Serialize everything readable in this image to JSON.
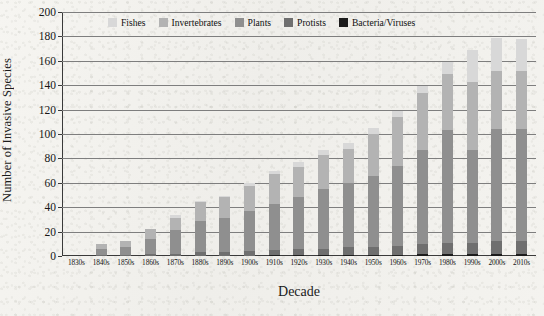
{
  "chart_data": {
    "type": "bar",
    "subtype": "stacked-bar",
    "title": "",
    "xlabel": "Decade",
    "ylabel": "Number of Invasive Species",
    "ylim": [
      0,
      200
    ],
    "ytick_step": 20,
    "yticks": [
      0,
      20,
      40,
      60,
      80,
      100,
      120,
      140,
      160,
      180,
      200
    ],
    "grid": "horizontal",
    "legend_position": "top-center-inside",
    "categories": [
      "1830s",
      "1840s",
      "1850s",
      "1860s",
      "1870s",
      "1880s",
      "1890s",
      "1900s",
      "1910s",
      "1920s",
      "1930s",
      "1940s",
      "1950s",
      "1960s",
      "1970s",
      "1980s",
      "1990s",
      "2000s",
      "2010s"
    ],
    "series": [
      {
        "name": "Bacteria/Viruses",
        "color": "#1c1c1c",
        "values": [
          0,
          0,
          0,
          0,
          0,
          0,
          0,
          0,
          1,
          1,
          1,
          1,
          1,
          1,
          2,
          2,
          2,
          2,
          2
        ]
      },
      {
        "name": "Protists",
        "color": "#6f6f6f",
        "values": [
          0,
          1,
          1,
          2,
          2,
          3,
          3,
          4,
          4,
          5,
          5,
          6,
          6,
          7,
          8,
          9,
          9,
          10,
          10
        ]
      },
      {
        "name": "Plants",
        "color": "#8f8f8f",
        "values": [
          0,
          5,
          6,
          12,
          19,
          26,
          28,
          33,
          38,
          42,
          49,
          53,
          59,
          66,
          77,
          92,
          76,
          92,
          92
        ]
      },
      {
        "name": "Invertebrates",
        "color": "#b3b3b3",
        "values": [
          0,
          4,
          5,
          8,
          10,
          15,
          17,
          20,
          24,
          25,
          28,
          28,
          34,
          40,
          47,
          46,
          56,
          48,
          48
        ]
      },
      {
        "name": "Fishes",
        "color": "#d8d8d8",
        "values": [
          0,
          0,
          0,
          0,
          3,
          1,
          1,
          3,
          3,
          4,
          4,
          5,
          5,
          5,
          5,
          10,
          26,
          27,
          26
        ]
      }
    ],
    "totals": [
      0,
      10,
      12,
      22,
      34,
      45,
      49,
      60,
      70,
      77,
      87,
      93,
      105,
      119,
      139,
      159,
      169,
      179,
      178
    ]
  },
  "axis": {
    "y_title": "Number of Invasive Species",
    "x_title": "Decade"
  }
}
